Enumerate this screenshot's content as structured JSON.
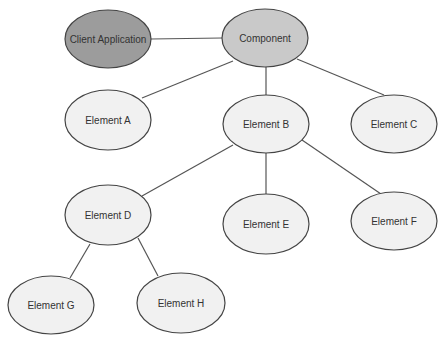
{
  "diagram": {
    "type": "tree",
    "colors": {
      "client_fill": "#9c9c9c",
      "component_fill": "#c9c9c9",
      "element_fill": "#f1f1f1",
      "stroke": "#444444",
      "edge": "#555555",
      "text": "#333333"
    },
    "nodes": [
      {
        "id": "client",
        "label": "Client Application",
        "cx": 108,
        "cy": 39,
        "rx": 43,
        "ry": 29,
        "fill": "#9c9c9c"
      },
      {
        "id": "component",
        "label": "Component",
        "cx": 265,
        "cy": 38,
        "rx": 43,
        "ry": 29,
        "fill": "#c9c9c9"
      },
      {
        "id": "a",
        "label": "Element A",
        "cx": 108,
        "cy": 120,
        "rx": 43,
        "ry": 30,
        "fill": "#f1f1f1"
      },
      {
        "id": "b",
        "label": "Element B",
        "cx": 266,
        "cy": 124,
        "rx": 43,
        "ry": 29,
        "fill": "#f1f1f1"
      },
      {
        "id": "c",
        "label": "Element C",
        "cx": 394,
        "cy": 124,
        "rx": 43,
        "ry": 29,
        "fill": "#f1f1f1"
      },
      {
        "id": "d",
        "label": "Element D",
        "cx": 108,
        "cy": 215,
        "rx": 43,
        "ry": 30,
        "fill": "#f1f1f1"
      },
      {
        "id": "e",
        "label": "Element E",
        "cx": 266,
        "cy": 224,
        "rx": 43,
        "ry": 30,
        "fill": "#f1f1f1"
      },
      {
        "id": "f",
        "label": "Element F",
        "cx": 394,
        "cy": 221,
        "rx": 43,
        "ry": 29,
        "fill": "#f1f1f1"
      },
      {
        "id": "g",
        "label": "Element G",
        "cx": 51,
        "cy": 305,
        "rx": 43,
        "ry": 29,
        "fill": "#f1f1f1"
      },
      {
        "id": "h",
        "label": "Element H",
        "cx": 181,
        "cy": 303,
        "rx": 44,
        "ry": 30,
        "fill": "#f1f1f1"
      }
    ],
    "edges": [
      {
        "from": "client",
        "to": "component",
        "x1": 151,
        "y1": 39,
        "x2": 222,
        "y2": 38
      },
      {
        "from": "component",
        "to": "a",
        "x1": 233,
        "y1": 61,
        "x2": 142,
        "y2": 98
      },
      {
        "from": "component",
        "to": "b",
        "x1": 266,
        "y1": 67,
        "x2": 266,
        "y2": 95
      },
      {
        "from": "component",
        "to": "c",
        "x1": 297,
        "y1": 59,
        "x2": 384,
        "y2": 95
      },
      {
        "from": "b",
        "to": "d",
        "x1": 233,
        "y1": 145,
        "x2": 142,
        "y2": 196
      },
      {
        "from": "b",
        "to": "e",
        "x1": 266,
        "y1": 153,
        "x2": 266,
        "y2": 194
      },
      {
        "from": "b",
        "to": "f",
        "x1": 302,
        "y1": 140,
        "x2": 381,
        "y2": 194
      },
      {
        "from": "d",
        "to": "g",
        "x1": 90,
        "y1": 244,
        "x2": 70,
        "y2": 278
      },
      {
        "from": "d",
        "to": "h",
        "x1": 138,
        "y1": 238,
        "x2": 158,
        "y2": 276
      }
    ]
  }
}
